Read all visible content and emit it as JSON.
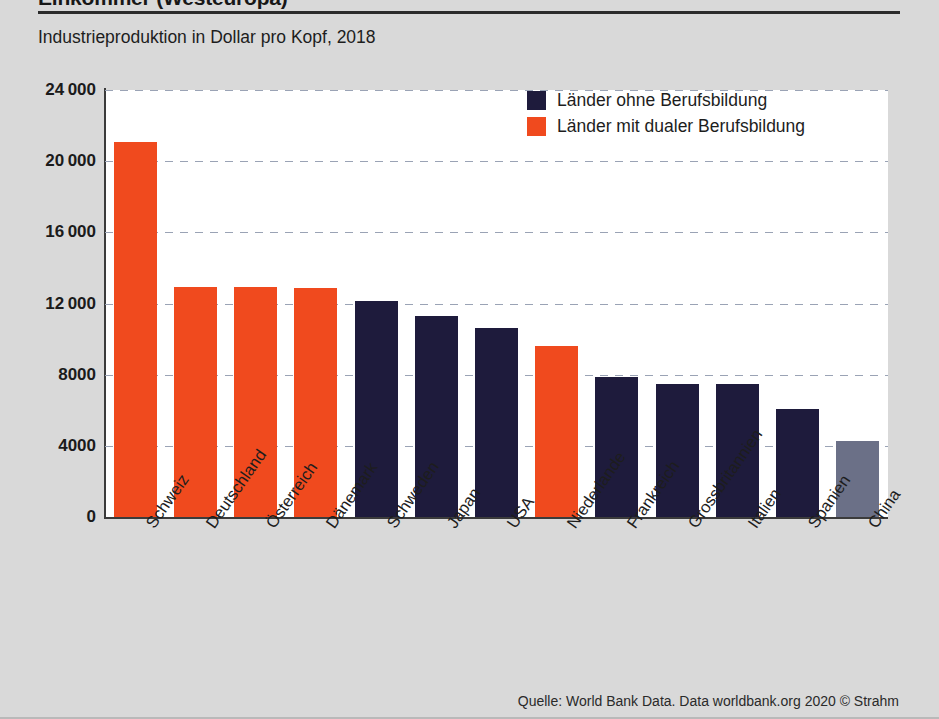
{
  "header": {
    "headline": "Einkommer (Westeuropa)",
    "subtitle": "Industrieproduktion in Dollar pro Kopf, 2018"
  },
  "legend": {
    "position": "top-right",
    "items": [
      {
        "label": "Länder ohne Berufsbildung",
        "color": "#1e1b3c"
      },
      {
        "label": "Länder mit dualer Berufsbildung",
        "color": "#f04a1e"
      }
    ]
  },
  "source": {
    "text": "Quelle: World Bank Data. Data worldbank.org 2020  © Strahm"
  },
  "colors": {
    "dual_vocational": "#f04a1e",
    "no_vocational": "#1e1b3c",
    "other": "#6b7087",
    "page_background": "#d9d9d9",
    "plot_background": "#ffffff",
    "axis": "#3b3b3b",
    "gridline": "#9aa3b5"
  },
  "chart_data": {
    "type": "bar",
    "title": "Industrieproduktion in Dollar pro Kopf, 2018",
    "xlabel": "",
    "ylabel": "",
    "ylim": [
      0,
      24000
    ],
    "yticks": [
      0,
      4000,
      8000,
      12000,
      16000,
      20000,
      24000
    ],
    "ytick_labels": [
      "0",
      "4000",
      "8000",
      "12 000",
      "16 000",
      "20 000",
      "24 000"
    ],
    "grid": true,
    "grid_axis": "y",
    "categories": [
      "Schweiz",
      "Deutschland",
      "Österreich",
      "Dänemark",
      "Schweden",
      "Japan",
      "USA",
      "Niederlande",
      "Frankreich",
      "Grossbritannien",
      "Italien",
      "Spanien",
      "China"
    ],
    "values": [
      21100,
      12950,
      12950,
      12850,
      12150,
      11300,
      10600,
      9600,
      7850,
      7500,
      7480,
      6050,
      4300
    ],
    "bar_colors": [
      "#f04a1e",
      "#f04a1e",
      "#f04a1e",
      "#f04a1e",
      "#1e1b3c",
      "#1e1b3c",
      "#1e1b3c",
      "#f04a1e",
      "#1e1b3c",
      "#1e1b3c",
      "#1e1b3c",
      "#1e1b3c",
      "#6b7087"
    ],
    "series_legend": [
      "Länder mit dualer Berufsbildung",
      "Länder mit dualer Berufsbildung",
      "Länder mit dualer Berufsbildung",
      "Länder mit dualer Berufsbildung",
      "Länder ohne Berufsbildung",
      "Länder ohne Berufsbildung",
      "Länder ohne Berufsbildung",
      "Länder mit dualer Berufsbildung",
      "Länder ohne Berufsbildung",
      "Länder ohne Berufsbildung",
      "Länder ohne Berufsbildung",
      "Länder ohne Berufsbildung",
      "Länder ohne Berufsbildung"
    ]
  }
}
